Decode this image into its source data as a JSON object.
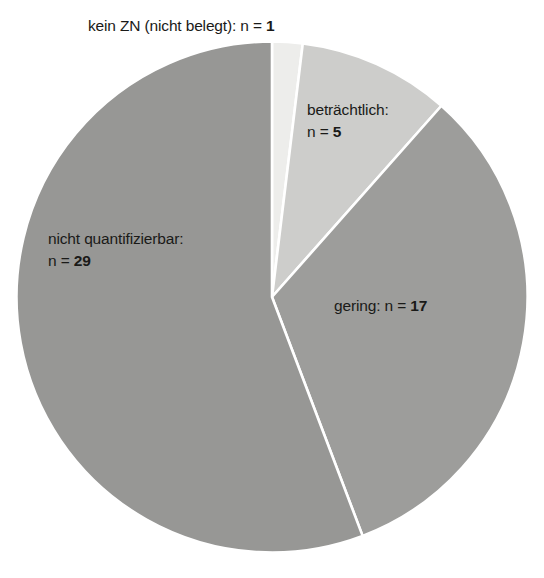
{
  "chart_data": {
    "type": "pie",
    "title": "",
    "subtitle": "",
    "xlabel": "",
    "ylabel": "",
    "total": 52,
    "legend_position": "none",
    "grid": false,
    "unit_label": "n",
    "categories": [
      "kein ZN (nicht belegt)",
      "beträchtlich",
      "gering",
      "nicht quantifizierbar"
    ],
    "values": [
      1,
      5,
      17,
      29
    ],
    "start_angle_deg": 0,
    "direction": "clockwise",
    "slices": [
      {
        "name": "kein-zn",
        "label": "kein ZN (nicht belegt)",
        "value": 1,
        "value_text": "1",
        "annotation": "kein ZN (nicht belegt): n = 1",
        "percent": 1.9,
        "angle_deg": 6.9,
        "color": "#ededeb"
      },
      {
        "name": "betraechtlich",
        "label": "beträchtlich",
        "value": 5,
        "value_text": "5",
        "annotation_line1": "beträchtlich:",
        "annotation_line2": "n = 5",
        "percent": 9.6,
        "angle_deg": 34.6,
        "color": "#cdcdcb"
      },
      {
        "name": "gering",
        "label": "gering",
        "value": 17,
        "value_text": "17",
        "annotation": "gering: n = 17",
        "percent": 32.7,
        "angle_deg": 117.7,
        "color": "#9d9d9b"
      },
      {
        "name": "nicht-quantifizierbar",
        "label": "nicht quantifizierbar",
        "value": 29,
        "value_text": "29",
        "annotation_line1": "nicht quantifizierbar:",
        "annotation_line2": "n = 29",
        "percent": 55.8,
        "angle_deg": 200.8,
        "color": "#979795"
      }
    ],
    "colors": {
      "background": "#ffffff",
      "divider": "#ffffff",
      "text": "#1a1a18",
      "kein_zn": "#ededeb",
      "betraechtlich": "#cdcdcb",
      "gering": "#9d9d9b",
      "nicht_quantifizierbar": "#979795"
    }
  },
  "labels": {
    "kein_zn_prefix": "kein ZN (nicht belegt): n = ",
    "kein_zn_value": "1",
    "betraechtlich_line1": "beträchtlich:",
    "betraechtlich_prefix": "n = ",
    "betraechtlich_value": "5",
    "nq_line1": "nicht quantifizierbar:",
    "nq_prefix": "n = ",
    "nq_value": "29",
    "gering_prefix": "gering: n = ",
    "gering_value": "17"
  }
}
